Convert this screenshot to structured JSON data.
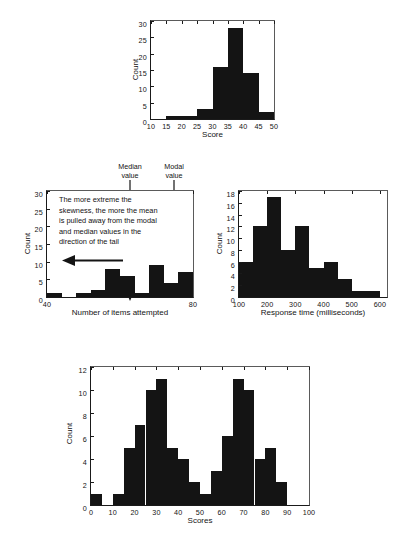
{
  "figure": {
    "panels": [
      {
        "id": "panel-a",
        "chart_data": {
          "type": "bar",
          "title": "",
          "subtitle": "",
          "xlabel": "Score",
          "ylabel": "Count",
          "xlim": [
            10,
            50
          ],
          "ylim": [
            0,
            30
          ],
          "bin_width": 5,
          "xticks": [
            10,
            15,
            20,
            25,
            30,
            35,
            40,
            45,
            50
          ],
          "yticks": [
            0,
            5,
            10,
            15,
            20,
            25,
            30
          ],
          "grid": false,
          "legend": "none",
          "bin_starts": [
            10,
            15,
            20,
            25,
            30,
            35,
            40,
            45
          ],
          "categories": [
            "10-15",
            "15-20",
            "20-25",
            "25-30",
            "30-35",
            "35-40",
            "40-45",
            "45-50"
          ],
          "values": [
            0,
            1,
            1,
            3,
            16,
            28,
            14,
            2
          ]
        }
      },
      {
        "id": "panel-b",
        "chart_data": {
          "type": "bar",
          "title": "",
          "subtitle": "",
          "xlabel": "Number of items attempted",
          "ylabel": "Count",
          "xlim": [
            40,
            80
          ],
          "ylim": [
            0,
            30
          ],
          "bin_width": 4,
          "xticks": [
            40,
            80
          ],
          "yticks": [
            0,
            5,
            10,
            15,
            20,
            25,
            30
          ],
          "grid": false,
          "legend": "none",
          "bin_starts": [
            40,
            44,
            48,
            52,
            56,
            60,
            64,
            68,
            72,
            76
          ],
          "categories": [
            "40-44",
            "44-48",
            "48-52",
            "52-56",
            "56-60",
            "60-64",
            "64-68",
            "68-72",
            "72-76",
            "76-80"
          ],
          "values": [
            1,
            0,
            1,
            2,
            8,
            6,
            1,
            9,
            4,
            7,
            25
          ],
          "annotations": {
            "note": "The more extreme the skewness, the more the mean is pulled away from the modal and median values in the direction of the tail",
            "markers": [
              {
                "label_line1": "Median",
                "label_line2": "value",
                "x": 69.5
              },
              {
                "label_line1": "Modal",
                "label_line2": "value",
                "x": 77.5
              }
            ]
          }
        }
      },
      {
        "id": "panel-c",
        "chart_data": {
          "type": "bar",
          "title": "",
          "subtitle": "",
          "xlabel": "Response time (milliseconds)",
          "ylabel": "Count",
          "xlim": [
            100,
            625
          ],
          "ylim": [
            0,
            18
          ],
          "bin_width": 50,
          "xticks": [
            100,
            200,
            300,
            400,
            500,
            600
          ],
          "yticks": [
            0,
            2,
            4,
            6,
            8,
            10,
            12,
            14,
            16,
            18
          ],
          "grid": false,
          "legend": "none",
          "bin_starts": [
            100,
            150,
            200,
            250,
            300,
            350,
            400,
            450,
            500,
            550
          ],
          "categories": [
            "100-150",
            "150-200",
            "200-250",
            "250-300",
            "300-350",
            "350-400",
            "400-450",
            "450-500",
            "500-550",
            "550-600"
          ],
          "values": [
            6,
            12,
            17,
            8,
            12,
            5,
            6,
            3,
            1,
            1
          ]
        }
      },
      {
        "id": "panel-d",
        "chart_data": {
          "type": "bar",
          "title": "",
          "subtitle": "",
          "xlabel": "Scores",
          "ylabel": "Count",
          "xlim": [
            0,
            100
          ],
          "ylim": [
            0,
            12
          ],
          "bin_width": 5,
          "xticks": [
            0,
            10,
            20,
            30,
            40,
            50,
            60,
            70,
            80,
            90,
            100
          ],
          "yticks": [
            0,
            2,
            4,
            6,
            8,
            10,
            12
          ],
          "grid": false,
          "legend": "none",
          "bin_starts": [
            0,
            5,
            10,
            15,
            20,
            25,
            30,
            35,
            40,
            45,
            50,
            55,
            60,
            65,
            70,
            75,
            80,
            85,
            90,
            95
          ],
          "categories": [
            "0-5",
            "5-10",
            "10-15",
            "15-20",
            "20-25",
            "25-30",
            "30-35",
            "35-40",
            "40-45",
            "45-50",
            "50-55",
            "55-60",
            "60-65",
            "65-70",
            "70-75",
            "75-80",
            "80-85",
            "85-90",
            "90-95",
            "95-100"
          ],
          "values": [
            1,
            0,
            1,
            5,
            7,
            10,
            11,
            5,
            4,
            2,
            1,
            3,
            6,
            11,
            10,
            4,
            5,
            2,
            0,
            0
          ]
        }
      }
    ]
  }
}
